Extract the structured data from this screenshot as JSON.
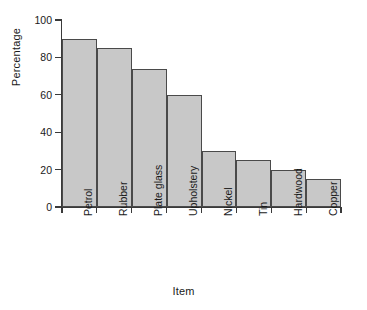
{
  "chart_data": {
    "type": "bar",
    "title": "",
    "xlabel": "Item",
    "ylabel": "Percentage",
    "categories": [
      "Petrol",
      "Rubber",
      "Plate glass",
      "Upholstery",
      "Nickel",
      "Tin",
      "Hardwood",
      "Copper"
    ],
    "values": [
      90,
      85,
      74,
      60,
      30,
      25,
      20,
      15
    ],
    "ylim": [
      0,
      100
    ],
    "yticks": [
      0,
      20,
      40,
      60,
      80,
      100
    ],
    "ytick_labels": [
      "0",
      "20",
      "40",
      "60",
      "80",
      "100"
    ],
    "grid": false,
    "legend": "none",
    "bar_style": {
      "fill": "#c8c8c8",
      "stroke": "#4a4a4a",
      "contiguous": true
    },
    "background": "#ffffff",
    "axis_color": "#3a3a3a"
  }
}
